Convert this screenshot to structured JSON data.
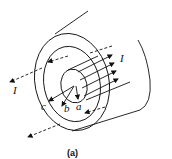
{
  "figure": {
    "caption": "(a)",
    "labels": {
      "current_outer": "I",
      "current_inner": "I",
      "radius_a": "a",
      "radius_b": "b",
      "radius_c": "c"
    },
    "colors": {
      "line": "#111111",
      "background": "#ffffff"
    }
  }
}
